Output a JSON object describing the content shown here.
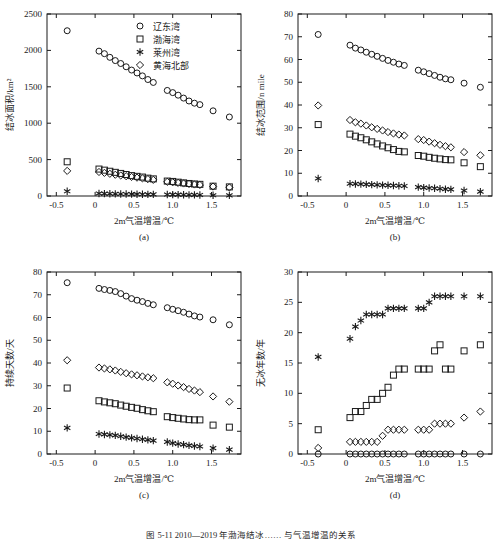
{
  "figure": {
    "caption": "图 5-11  2010—2019 年渤海结冰…… 与气温增温的关系",
    "panel_tags": [
      "(a)",
      "(b)",
      "(c)",
      "(d)"
    ]
  },
  "legend": {
    "position": "top-right-panel-a",
    "entries": [
      {
        "marker": "circle",
        "label": "辽东湾"
      },
      {
        "marker": "square",
        "label": "渤海湾"
      },
      {
        "marker": "star",
        "label": "莱州湾"
      },
      {
        "marker": "diamond",
        "label": "黄海北部"
      }
    ]
  },
  "chart_data": [
    {
      "type": "scatter",
      "panel": "(a)",
      "title": "",
      "xlabel": "2m气温增温/℃",
      "ylabel": "结冰面积/km²",
      "xlim": [
        -0.62,
        1.88
      ],
      "ylim": [
        0,
        2500
      ],
      "xticks": [
        -0.5,
        0,
        0.5,
        1.0,
        1.5
      ],
      "xticklabels": [
        "-0.5",
        "0",
        "0.5",
        "1.0",
        "1.5"
      ],
      "yticks": [
        0,
        500,
        1000,
        1500,
        2000,
        2500
      ],
      "yticklabels": [
        "0",
        "500",
        "1000",
        "1500",
        "2000",
        "2500"
      ],
      "grid": false,
      "x": [
        -0.36,
        0.05,
        0.12,
        0.19,
        0.26,
        0.33,
        0.4,
        0.47,
        0.54,
        0.61,
        0.68,
        0.75,
        0.93,
        1.0,
        1.07,
        1.14,
        1.21,
        1.28,
        1.35,
        1.52,
        1.73
      ],
      "series": [
        {
          "name": "辽东湾",
          "marker": "circle",
          "values": [
            2270,
            1990,
            1955,
            1905,
            1860,
            1820,
            1775,
            1730,
            1690,
            1650,
            1600,
            1560,
            1450,
            1420,
            1385,
            1345,
            1305,
            1275,
            1255,
            1170,
            1085
          ]
        },
        {
          "name": "渤海湾",
          "marker": "square",
          "values": [
            470,
            370,
            355,
            340,
            325,
            310,
            295,
            280,
            270,
            260,
            245,
            235,
            205,
            200,
            190,
            180,
            172,
            165,
            160,
            135,
            125
          ]
        },
        {
          "name": "莱州湾",
          "marker": "star",
          "values": [
            65,
            35,
            33,
            31,
            29,
            28,
            27,
            26,
            25,
            24,
            23,
            22,
            20,
            19,
            18,
            17,
            16,
            15,
            14,
            10,
            8
          ]
        },
        {
          "name": "黄海北部",
          "marker": "diamond",
          "values": [
            345,
            330,
            318,
            305,
            292,
            282,
            272,
            262,
            252,
            242,
            232,
            222,
            195,
            188,
            180,
            172,
            165,
            158,
            152,
            130,
            118
          ]
        }
      ]
    },
    {
      "type": "scatter",
      "panel": "(b)",
      "title": "",
      "xlabel": "2m气温增温/℃",
      "ylabel": "结冰范围/n mile",
      "xlim": [
        -0.62,
        1.88
      ],
      "ylim": [
        0,
        80
      ],
      "xticks": [
        -0.5,
        0,
        0.5,
        1.0,
        1.5
      ],
      "xticklabels": [
        "-0.5",
        "0",
        "0.5",
        "1.0",
        "1.5"
      ],
      "yticks": [
        0,
        10,
        20,
        30,
        40,
        50,
        60,
        70,
        80
      ],
      "yticklabels": [
        "0",
        "10",
        "20",
        "30",
        "40",
        "50",
        "60",
        "70",
        "80"
      ],
      "grid": false,
      "x": [
        -0.36,
        0.05,
        0.12,
        0.19,
        0.26,
        0.33,
        0.4,
        0.47,
        0.54,
        0.61,
        0.68,
        0.75,
        0.93,
        1.0,
        1.07,
        1.14,
        1.21,
        1.28,
        1.35,
        1.52,
        1.73
      ],
      "series": [
        {
          "name": "辽东湾",
          "marker": "circle",
          "values": [
            71.0,
            66.3,
            65.0,
            64.2,
            63.2,
            62.3,
            61.4,
            60.5,
            59.6,
            58.8,
            58.0,
            57.4,
            55.3,
            54.6,
            53.8,
            53.0,
            52.2,
            51.5,
            51.1,
            49.6,
            47.8
          ]
        },
        {
          "name": "渤海湾",
          "marker": "square",
          "values": [
            31.4,
            27.2,
            26.3,
            25.6,
            24.7,
            23.8,
            22.9,
            22.0,
            21.2,
            20.4,
            19.6,
            19.4,
            17.8,
            17.5,
            17.0,
            16.6,
            16.3,
            16.0,
            15.9,
            14.6,
            12.9
          ]
        },
        {
          "name": "莱州湾",
          "marker": "star",
          "values": [
            7.7,
            5.4,
            5.3,
            5.2,
            5.1,
            5.0,
            4.9,
            4.8,
            4.7,
            4.6,
            4.5,
            4.4,
            3.9,
            3.7,
            3.5,
            3.4,
            3.2,
            3.0,
            2.9,
            2.4,
            1.9
          ]
        },
        {
          "name": "黄海北部",
          "marker": "diamond",
          "values": [
            39.8,
            33.4,
            32.4,
            31.8,
            31.0,
            30.2,
            29.5,
            28.8,
            28.1,
            27.5,
            27.0,
            26.6,
            25.0,
            24.6,
            23.9,
            23.2,
            22.5,
            21.9,
            21.4,
            19.3,
            17.9
          ]
        }
      ]
    },
    {
      "type": "scatter",
      "panel": "(c)",
      "title": "",
      "xlabel": "2m气温增温/℃",
      "ylabel": "持续天数/天",
      "xlim": [
        -0.62,
        1.88
      ],
      "ylim": [
        0,
        80
      ],
      "xticks": [
        -0.5,
        0,
        0.5,
        1.0,
        1.5
      ],
      "xticklabels": [
        "-0.5",
        "0",
        "0.5",
        "1.0",
        "1.5"
      ],
      "yticks": [
        0,
        10,
        20,
        30,
        40,
        50,
        60,
        70,
        80
      ],
      "yticklabels": [
        "0",
        "10",
        "20",
        "30",
        "40",
        "50",
        "60",
        "70",
        "80"
      ],
      "grid": false,
      "x": [
        -0.36,
        0.05,
        0.12,
        0.19,
        0.26,
        0.33,
        0.4,
        0.47,
        0.54,
        0.61,
        0.68,
        0.75,
        0.93,
        1.0,
        1.07,
        1.14,
        1.21,
        1.28,
        1.35,
        1.52,
        1.73
      ],
      "series": [
        {
          "name": "辽东湾",
          "marker": "circle",
          "values": [
            75.3,
            72.8,
            72.3,
            71.9,
            71.4,
            70.5,
            69.4,
            68.3,
            67.6,
            67.0,
            66.2,
            65.6,
            64.3,
            63.6,
            63.0,
            62.3,
            61.5,
            60.7,
            60.2,
            59.0,
            56.8
          ]
        },
        {
          "name": "渤海湾",
          "marker": "square",
          "values": [
            29.0,
            23.4,
            22.9,
            22.5,
            22.1,
            21.5,
            21.0,
            20.5,
            20.1,
            19.5,
            19.0,
            18.6,
            16.4,
            16.0,
            15.7,
            15.4,
            15.1,
            15.0,
            15.0,
            12.7,
            11.8
          ]
        },
        {
          "name": "莱州湾",
          "marker": "star",
          "values": [
            11.5,
            8.8,
            8.6,
            8.4,
            8.2,
            7.8,
            7.4,
            7.1,
            6.8,
            6.5,
            6.2,
            5.9,
            5.3,
            4.8,
            4.4,
            4.1,
            3.8,
            3.5,
            3.3,
            2.6,
            1.9
          ]
        },
        {
          "name": "黄海北部",
          "marker": "diamond",
          "values": [
            41.2,
            38.0,
            37.6,
            37.2,
            36.7,
            36.1,
            35.5,
            35.0,
            34.6,
            34.1,
            33.7,
            33.3,
            31.5,
            30.9,
            30.1,
            29.4,
            28.6,
            27.9,
            27.2,
            25.3,
            23.0
          ]
        }
      ]
    },
    {
      "type": "scatter",
      "panel": "(d)",
      "title": "",
      "xlabel": "2m气温增温/℃",
      "ylabel": "无冰年数/年",
      "xlim": [
        -0.62,
        1.88
      ],
      "ylim": [
        0,
        30
      ],
      "xticks": [
        -0.5,
        0,
        0.5,
        1.0,
        1.5
      ],
      "xticklabels": [
        "-0.5",
        "0",
        "0.5",
        "1.0",
        "1.5"
      ],
      "yticks": [
        0,
        5,
        10,
        15,
        20,
        25,
        30
      ],
      "yticklabels": [
        "0",
        "5",
        "10",
        "15",
        "20",
        "25",
        "30"
      ],
      "grid": false,
      "x": [
        -0.36,
        0.05,
        0.12,
        0.19,
        0.26,
        0.33,
        0.4,
        0.47,
        0.54,
        0.61,
        0.68,
        0.75,
        0.93,
        1.0,
        1.07,
        1.14,
        1.21,
        1.28,
        1.35,
        1.52,
        1.73
      ],
      "series": [
        {
          "name": "辽东湾",
          "marker": "circle",
          "values": [
            0,
            0,
            0,
            0,
            0,
            0,
            0,
            0,
            0,
            0,
            0,
            0,
            0,
            0,
            0,
            0,
            0,
            0,
            0,
            0,
            0
          ]
        },
        {
          "name": "渤海湾",
          "marker": "square",
          "values": [
            4,
            6,
            7,
            7,
            8,
            9,
            9,
            10,
            11,
            13,
            14,
            14,
            14,
            14,
            14,
            17,
            18,
            14,
            14,
            17,
            18
          ]
        },
        {
          "name": "莱州湾",
          "marker": "star",
          "values": [
            16,
            19,
            21,
            22,
            23,
            23,
            23,
            23,
            24,
            24,
            24,
            24,
            24,
            24,
            25,
            26,
            26,
            26,
            26,
            26,
            26
          ]
        },
        {
          "name": "黄海北部",
          "marker": "diamond",
          "values": [
            1,
            2,
            2,
            2,
            2,
            2,
            2,
            3,
            4,
            4,
            4,
            4,
            4,
            4,
            4,
            5,
            5,
            5,
            5,
            6,
            7
          ]
        }
      ]
    }
  ]
}
